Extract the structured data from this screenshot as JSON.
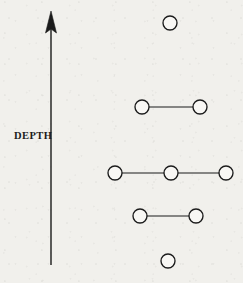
{
  "figure": {
    "width": 243,
    "height": 283,
    "background_color": "#f1f0ec",
    "ink_color": "#1b1b1b"
  },
  "axis": {
    "label": "DEPTH",
    "label_x": 14,
    "label_y": 131,
    "direction": "up",
    "shaft_x": 51,
    "shaft_top_y": 26,
    "shaft_bottom_y": 265,
    "arrowhead_tip_y": 11,
    "arrowhead_base_y": 33,
    "arrowhead_half_width": 5.5,
    "line_width": 1.4
  },
  "marker_style": {
    "shape": "open-circle",
    "radius": 7,
    "fill": "#f8f7f4",
    "stroke": "#1b1b1b",
    "stroke_width": 1.35
  },
  "connector_style": {
    "stroke": "#1b1b1b",
    "stroke_width": 1.2
  },
  "chart_data": {
    "type": "scatter",
    "title": "",
    "xlabel": "",
    "ylabel": "DEPTH",
    "grid": false,
    "legend": null,
    "axes": {
      "y_axis_arrow": true,
      "y_axis_direction": "increasing-upward",
      "x_axis_visible": false,
      "y_tick_labels": [],
      "x_tick_labels": []
    },
    "rows": [
      {
        "level": 1,
        "y": 23,
        "count": 1,
        "points": [
          {
            "x": 170,
            "y": 23
          }
        ],
        "connected": false
      },
      {
        "level": 2,
        "y": 107,
        "count": 2,
        "points": [
          {
            "x": 142,
            "y": 107
          },
          {
            "x": 200,
            "y": 107
          }
        ],
        "connected": true
      },
      {
        "level": 3,
        "y": 173,
        "count": 3,
        "points": [
          {
            "x": 115,
            "y": 173
          },
          {
            "x": 171,
            "y": 173
          },
          {
            "x": 226,
            "y": 173
          }
        ],
        "connected": true
      },
      {
        "level": 4,
        "y": 216,
        "count": 2,
        "points": [
          {
            "x": 140,
            "y": 216
          },
          {
            "x": 196,
            "y": 216
          }
        ],
        "connected": true
      },
      {
        "level": 5,
        "y": 261,
        "count": 1,
        "points": [
          {
            "x": 168,
            "y": 261
          }
        ],
        "connected": false
      }
    ]
  }
}
